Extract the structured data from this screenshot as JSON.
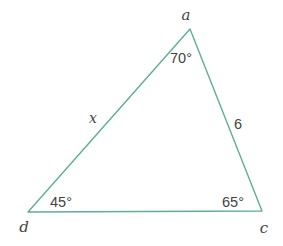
{
  "figure": {
    "type": "triangle-diagram",
    "stroke_color": "#5fae94",
    "background_color": "#ffffff",
    "text_color": "#434343",
    "vertices": [
      {
        "name": "a",
        "label": "a",
        "x": 190,
        "y": 29,
        "label_x": 186,
        "label_y": 15
      },
      {
        "name": "c",
        "label": "c",
        "x": 262,
        "y": 211,
        "label_x": 264,
        "label_y": 228
      },
      {
        "name": "d",
        "label": "d",
        "x": 28,
        "y": 212,
        "label_x": 24,
        "label_y": 227
      }
    ],
    "angles": [
      {
        "at": "a",
        "label": "70°",
        "x": 181,
        "y": 58
      },
      {
        "at": "d",
        "label": "45°",
        "x": 61,
        "y": 202
      },
      {
        "at": "c",
        "label": "65°",
        "x": 233,
        "y": 202
      }
    ],
    "sides": [
      {
        "between": "a-d",
        "label": "x",
        "x": 93,
        "y": 118,
        "style": "italic"
      },
      {
        "between": "a-c",
        "label": "6",
        "x": 238,
        "y": 124,
        "style": "normal"
      },
      {
        "between": "d-c",
        "label": "",
        "x": 0,
        "y": 0,
        "style": "normal"
      }
    ]
  }
}
